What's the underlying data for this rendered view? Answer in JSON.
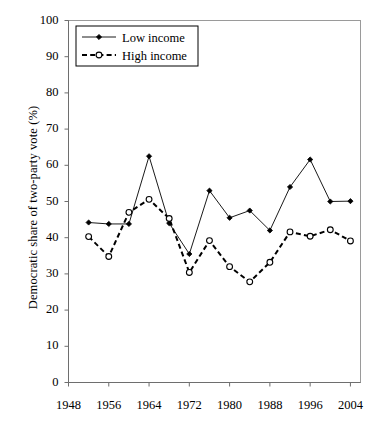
{
  "chart_data": {
    "type": "line",
    "title": "",
    "xlabel": "",
    "ylabel": "Democratic share of two-party vote (%)",
    "xlim": [
      1948,
      2006
    ],
    "ylim": [
      0,
      100
    ],
    "ytick_labels": [
      "0",
      "10",
      "20",
      "30",
      "40",
      "50",
      "60",
      "70",
      "80",
      "90",
      "100"
    ],
    "yticks": [
      0,
      10,
      20,
      30,
      40,
      50,
      60,
      70,
      80,
      90,
      100
    ],
    "xtick_labels": [
      "1948",
      "1956",
      "1964",
      "1972",
      "1980",
      "1988",
      "1996",
      "2004"
    ],
    "xticks": [
      1948,
      1956,
      1964,
      1972,
      1980,
      1988,
      1996,
      2004
    ],
    "grid": false,
    "legend_position": "top-left",
    "x": [
      1952,
      1956,
      1960,
      1964,
      1968,
      1972,
      1976,
      1980,
      1984,
      1988,
      1992,
      1996,
      2000,
      2004
    ],
    "series": [
      {
        "name": "Low income",
        "line_style": "solid",
        "marker": "filled-diamond",
        "color": "#000000",
        "values": [
          44.2,
          43.8,
          43.8,
          62.5,
          44.0,
          35.5,
          53.0,
          45.5,
          47.5,
          42.0,
          54.0,
          61.6,
          50.0,
          50.1
        ]
      },
      {
        "name": "High income",
        "line_style": "dashed",
        "marker": "open-circle",
        "color": "#000000",
        "values": [
          40.3,
          34.8,
          47.0,
          50.6,
          45.3,
          30.4,
          39.2,
          32.0,
          27.8,
          33.2,
          41.6,
          40.4,
          42.2,
          39.1
        ]
      }
    ]
  },
  "legend": {
    "items": [
      {
        "label": "Low income"
      },
      {
        "label": "High income"
      }
    ]
  },
  "axes": {
    "y_title": "Democratic share of two-party vote (%)"
  }
}
